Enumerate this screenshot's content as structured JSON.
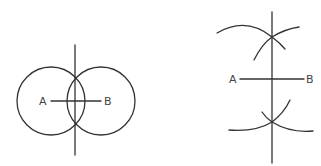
{
  "figure": {
    "stroke_color": "#333333",
    "label_color": "#444444",
    "background": "#ffffff"
  },
  "left_diagram": {
    "description": "Two equal circles centered at A and B; their intersections define the perpendicular bisector of AB",
    "point_a": {
      "label": "A",
      "x": 51,
      "y": 101
    },
    "point_b": {
      "label": "B",
      "x": 101,
      "y": 101
    },
    "circle_radius": 34,
    "bisector": {
      "x": 75,
      "y_top": 45,
      "y_bottom": 155
    }
  },
  "right_diagram": {
    "description": "Arcs drawn from A and B above and below segment AB intersect on the perpendicular bisector",
    "point_a": {
      "label": "A",
      "x": 240,
      "y": 79
    },
    "point_b": {
      "label": "B",
      "x": 304,
      "y": 79
    },
    "bisector": {
      "x": 272,
      "y_top": 12,
      "y_bottom": 163
    },
    "upper_intersection": {
      "x": 272,
      "y": 37
    },
    "lower_intersection": {
      "x": 272,
      "y": 122
    }
  }
}
